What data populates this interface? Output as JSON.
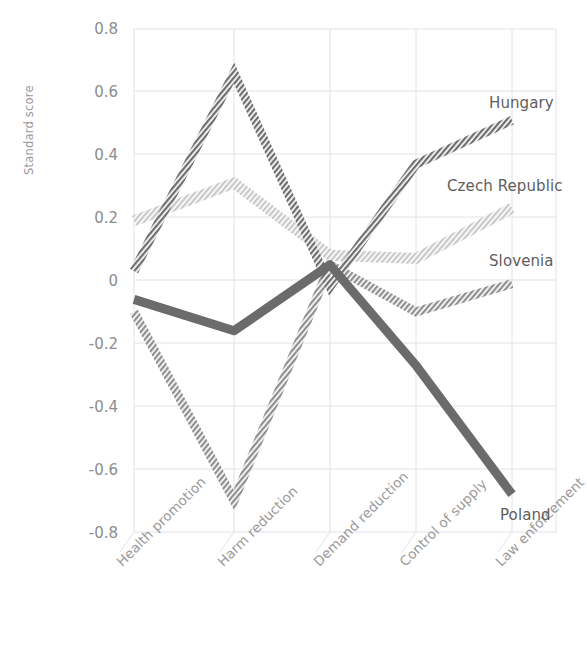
{
  "chart_data": {
    "type": "line",
    "title": "",
    "xlabel": "",
    "ylabel": "Standard score",
    "ylim": [
      -0.8,
      0.8
    ],
    "yticks": [
      "0.8",
      "0.6",
      "0.4",
      "0.2",
      "0",
      "-0.2",
      "-0.4",
      "-0.6",
      "-0.8"
    ],
    "ytick_values": [
      0.8,
      0.6,
      0.4,
      0.2,
      0,
      -0.2,
      -0.4,
      -0.6,
      -0.8
    ],
    "grid": true,
    "legend_position": "inline-right-of-line-end",
    "categories": [
      "Health promotion",
      "Harm reduction",
      "Demand reduction",
      "Control of supply",
      "Law enforcement"
    ],
    "series": [
      {
        "name": "Hungary",
        "color": "#6e6e6e",
        "style": "hatched",
        "values": [
          0.03,
          0.66,
          -0.02,
          0.37,
          0.51
        ]
      },
      {
        "name": "Czech Republic",
        "color": "#c9c9c9",
        "style": "hatched",
        "values": [
          0.19,
          0.31,
          0.08,
          0.07,
          0.23
        ]
      },
      {
        "name": "Slovenia",
        "color": "#8f8f8f",
        "style": "hatched",
        "values": [
          -0.1,
          -0.7,
          0.05,
          -0.1,
          -0.01
        ]
      },
      {
        "name": "Poland",
        "color": "#6b6b6b",
        "style": "solid",
        "values": [
          -0.06,
          -0.16,
          0.05,
          -0.27,
          -0.68
        ]
      }
    ]
  },
  "labels": {
    "hungary": "Hungary",
    "czech_republic": "Czech Republic",
    "slovenia": "Slovenia",
    "poland": "Poland"
  },
  "axis": {
    "y_title": "Standard score",
    "y_ticks": [
      "0.8",
      "0.6",
      "0.4",
      "0.2",
      "0",
      "-0.2",
      "-0.4",
      "-0.6",
      "-0.8"
    ],
    "x_ticks": [
      "Health promotion",
      "Harm reduction",
      "Demand reduction",
      "Control of supply",
      "Law enforcement"
    ]
  },
  "colors": {
    "grid": "#e2e2ea",
    "axis_text": "#8d8d8d",
    "series_label_text": "#5e5e5e",
    "hungary": "#6e6e6e",
    "czech_republic": "#c9c9c9",
    "slovenia": "#8f8f8f",
    "poland": "#6b6b6b"
  }
}
